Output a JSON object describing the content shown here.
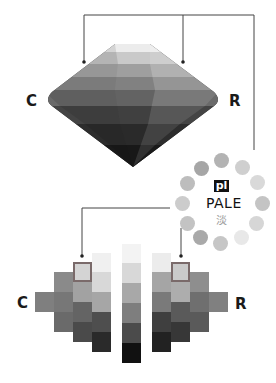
{
  "labels": {
    "top_left": "C",
    "top_right": "R",
    "bottom_left": "C",
    "bottom_right": "R"
  },
  "tone": {
    "badge": "pl",
    "name": "PALE",
    "kanji": "淡"
  },
  "tone_ring_colors": [
    "#b3b3b3",
    "#cfcfcf",
    "#d9d9d9",
    "#d2d2d2",
    "#d6d6d6",
    "#e8e8e8",
    "#c6c6c6",
    "#a9a9a9",
    "#c3c3c3",
    "#cccccc",
    "#bdbdbd",
    "#a6a6a6"
  ],
  "center_strip": [
    "#d8d8d8",
    "#a8a8a8",
    "#7e7e7e",
    "#4b4b4b",
    "#111111"
  ],
  "center_strip_top": "#f3f3f3",
  "left_grid": {
    "col1": [
      "#7f7f7f"
    ],
    "col2": [
      "#8a8a8a",
      "#777777",
      "#6a6a6a"
    ],
    "col3": [
      "#d4d4d4",
      "#a2a2a2",
      "#646464",
      "#4a4a4a"
    ],
    "col4": [
      "#f0f0f0",
      "#d8d8d8",
      "#a6a6a6",
      "#4e4e4e",
      "#2a2a2a"
    ]
  },
  "right_grid": {
    "col1": [
      "#ececec",
      "#a5a5a5",
      "#7a7a7a",
      "#3f3f3f",
      "#222222"
    ],
    "col2": [
      "#cacaca",
      "#adadad",
      "#5a5a5a",
      "#373737"
    ],
    "col3": [
      "#8e8e8e",
      "#6f6f6f",
      "#5a5a5a"
    ],
    "col4": [
      "#808080"
    ]
  },
  "highlight_border": "#7a6a6a"
}
